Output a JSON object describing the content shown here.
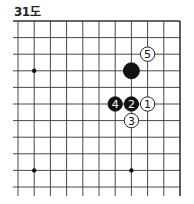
{
  "diagram": {
    "title": "31도",
    "board": {
      "columns": 11,
      "rows": 11,
      "edges": {
        "top": "closed",
        "right": "closed",
        "left": "open",
        "bottom": "open"
      },
      "star_points": [
        {
          "col": 1,
          "row": 3
        },
        {
          "col": 1,
          "row": 9
        },
        {
          "col": 7,
          "row": 9
        }
      ],
      "stones": [
        {
          "col": 7,
          "row": 3,
          "color": "black",
          "label": ""
        },
        {
          "col": 8,
          "row": 5,
          "color": "white",
          "label": "1"
        },
        {
          "col": 7,
          "row": 5,
          "color": "black",
          "label": "2"
        },
        {
          "col": 7,
          "row": 6,
          "color": "white",
          "label": "3"
        },
        {
          "col": 6,
          "row": 5,
          "color": "black",
          "label": "4"
        },
        {
          "col": 8,
          "row": 2,
          "color": "white",
          "label": "5"
        }
      ]
    },
    "colors": {
      "line": "#333333",
      "black_stone": "#111111",
      "white_stone": "#ffffff"
    }
  }
}
